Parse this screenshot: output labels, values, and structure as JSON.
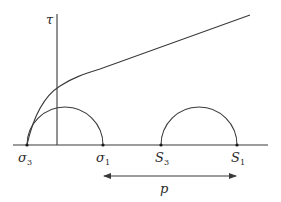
{
  "diagram": {
    "type": "mohr-circle-failure-envelope",
    "axis": {
      "label": "τ"
    },
    "labels": {
      "sigma3": {
        "base": "σ",
        "sub": "3"
      },
      "sigma1": {
        "base": "σ",
        "sub": "1"
      },
      "S3": {
        "base": "S",
        "sub": "3"
      },
      "S1": {
        "base": "S",
        "sub": "1"
      }
    },
    "arrow": {
      "label": "p"
    },
    "colors": {
      "line": "#3a3a3a",
      "text": "#2a2a2a"
    }
  }
}
